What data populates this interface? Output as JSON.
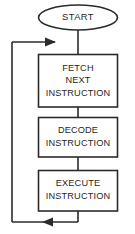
{
  "diagram": {
    "background_color": "#ffffff",
    "line_color": "#2b2b2b",
    "text_color": "#1f1f1f",
    "nodes": [
      {
        "id": "start",
        "shape": "ellipse",
        "label": "START",
        "lines": [
          "START"
        ]
      },
      {
        "id": "fetch",
        "shape": "rectangle",
        "label": "FETCH NEXT INSTRUCTION",
        "lines": [
          "FETCH",
          "NEXT",
          "INSTRUCTION"
        ]
      },
      {
        "id": "decode",
        "shape": "rectangle",
        "label": "DECODE INSTRUCTION",
        "lines": [
          "DECODE",
          "INSTRUCTION"
        ]
      },
      {
        "id": "execute",
        "shape": "rectangle",
        "label": "EXECUTE INSTRUCTION",
        "lines": [
          "EXECUTE",
          "INSTRUCTION"
        ]
      }
    ],
    "edges": [
      {
        "id": "start-to-fetch",
        "from": "start",
        "to": "fetch",
        "label": "",
        "arrow": false
      },
      {
        "id": "fetch-to-decode",
        "from": "fetch",
        "to": "decode",
        "label": "",
        "arrow": false
      },
      {
        "id": "decode-to-execute",
        "from": "decode",
        "to": "execute",
        "label": "",
        "arrow": false
      },
      {
        "id": "execute-loop-back",
        "from": "execute",
        "to": "fetch",
        "label": "",
        "arrow": true
      }
    ]
  }
}
